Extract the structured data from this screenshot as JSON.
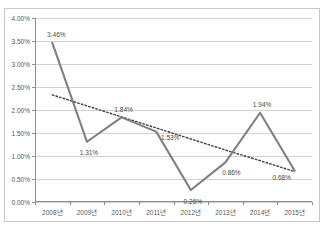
{
  "title": "",
  "chart_data": {
    "type": "line",
    "title": "",
    "xlabel": "",
    "ylabel": "",
    "ylim": [
      0,
      4
    ],
    "ytick_step": 0.5,
    "grid": true,
    "legend": "none",
    "categories": [
      "2008년",
      "2009년",
      "2010년",
      "2011년",
      "2012년",
      "2013년",
      "2014년",
      "2015년"
    ],
    "ytick_labels": [
      "0.00%",
      "0.50%",
      "1.00%",
      "1.50%",
      "2.00%",
      "2.50%",
      "3.00%",
      "3.50%",
      "4.00%"
    ],
    "ytick_values": [
      0,
      0.5,
      1.0,
      1.5,
      2.0,
      2.5,
      3.0,
      3.5,
      4.0
    ],
    "series": [
      {
        "name": "값",
        "style": "solid",
        "color": "#7f7f7f",
        "values": [
          3.46,
          1.31,
          1.84,
          1.53,
          0.26,
          0.86,
          1.94,
          0.68
        ],
        "data_labels": [
          "3.46%",
          "1.31%",
          "1.84%",
          "1.53%",
          "0.26%",
          "0.86%",
          "1.94%",
          "0.68%"
        ],
        "label_offsets": [
          {
            "dx": 4,
            "dy": -9
          },
          {
            "dx": 2,
            "dy": 10
          },
          {
            "dx": 2,
            "dy": -8
          },
          {
            "dx": 14,
            "dy": 5
          },
          {
            "dx": 2,
            "dy": 11
          },
          {
            "dx": 6,
            "dy": 10
          },
          {
            "dx": 2,
            "dy": -9
          },
          {
            "dx": -13,
            "dy": 6
          }
        ]
      },
      {
        "name": "추세선",
        "style": "dotted",
        "color": "#3f3f3f",
        "values": [
          2.33,
          2.09,
          1.85,
          1.61,
          1.37,
          1.13,
          0.9,
          0.66
        ]
      }
    ]
  },
  "colors": {
    "series_line": "#7f7f7f",
    "trendline": "#3f3f3f",
    "gridline": "#d2d2d2",
    "axis": "#8c8c8c",
    "frame_border": "#c8c8c8",
    "plot_background": "#ffffff",
    "tick_text": "#595959",
    "label_text": "#4a4a4a"
  }
}
